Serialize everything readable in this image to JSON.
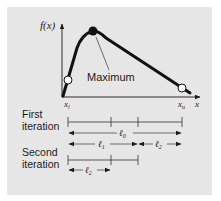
{
  "figure": {
    "y_axis_label": "f(x)",
    "x_axis_label": "x",
    "peak_label": "Maximum",
    "lower_bound_label": "x",
    "lower_bound_sub": "l",
    "upper_bound_label": "x",
    "upper_bound_sub": "u",
    "colors": {
      "panel": "#e6e6e6",
      "ink": "#1a1a1a",
      "point_fill": "#ffffff"
    }
  },
  "iterations": [
    {
      "label_line1": "First",
      "label_line2": "iteration",
      "lengths": [
        {
          "symbol": "ℓ",
          "sub": "0"
        },
        {
          "symbol": "ℓ",
          "sub": "1"
        },
        {
          "symbol": "ℓ",
          "sub": "2"
        }
      ]
    },
    {
      "label_line1": "Second",
      "label_line2": "iteration",
      "lengths": [
        {
          "symbol": "ℓ",
          "sub": "2"
        }
      ]
    }
  ]
}
